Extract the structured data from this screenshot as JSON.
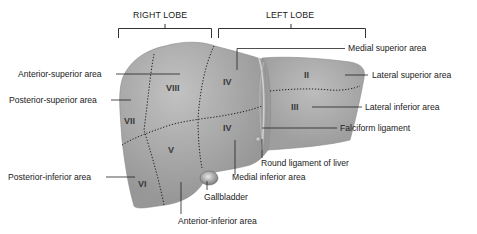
{
  "diagram": {
    "lobes": {
      "right": "RIGHT LOBE",
      "left": "LEFT LOBE"
    },
    "segments": {
      "II": "II",
      "III": "III",
      "IV_upper": "IV",
      "IV_lower": "IV",
      "V": "V",
      "VI": "VI",
      "VII": "VII",
      "VIII": "VIII"
    },
    "labels": {
      "anterior_superior": "Anterior-superior area",
      "posterior_superior": "Posterior-superior area",
      "posterior_inferior": "Posterior-inferior area",
      "medial_superior": "Medial superior area",
      "lateral_superior": "Lateral superior area",
      "lateral_inferior": "Lateral inferior area",
      "falciform": "Falciform ligament",
      "round_ligament": "Round ligament of liver",
      "medial_inferior": "Medial inferior area",
      "gallbladder": "Gallbladder",
      "anterior_inferior": "Anterior-inferior area"
    },
    "colors": {
      "liver_fill": "#a3a3a3",
      "liver_highlight": "#bdbdbd",
      "line": "#2a2a2a",
      "text": "#1a1a1a"
    }
  }
}
